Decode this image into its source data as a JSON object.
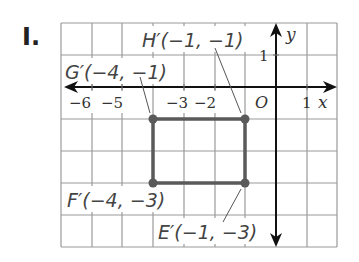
{
  "problem": {
    "label": "I."
  },
  "axes": {
    "x_label": "x",
    "y_label": "y",
    "origin_label": "O",
    "x_ticks": [
      "−6",
      "−5",
      "−3",
      "−2",
      "1"
    ],
    "y_ticks": [
      "1"
    ]
  },
  "points": [
    {
      "name": "H'",
      "label": "H′(−1, −1)",
      "x": -1,
      "y": -1
    },
    {
      "name": "G'",
      "label": "G′(−4, −1)",
      "x": -4,
      "y": -1
    },
    {
      "name": "F'",
      "label": "F′(−4, −3)",
      "x": -4,
      "y": -3
    },
    {
      "name": "E'",
      "label": "E′(−1, −3)",
      "x": -1,
      "y": -3
    }
  ],
  "colors": {
    "grid": "#9a9a9a",
    "axis": "#111111",
    "shape": "#5a5a5a",
    "text": "#444444"
  }
}
